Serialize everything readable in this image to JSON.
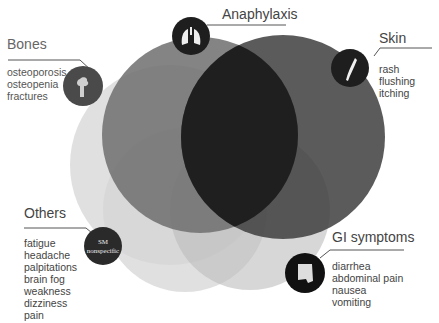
{
  "diagram": {
    "type": "venn",
    "colors": {
      "anaphylaxis_circle": "#777777",
      "skin_circle": "#555555",
      "bones_circle": "#d8d8d8",
      "others_circle": "#dcdcdc",
      "gi_circle": "#c8c8c8",
      "icon_badge": "#1e1e1e",
      "text": "#444444",
      "leader_line": "#555555"
    },
    "groups": [
      {
        "id": "anaphylaxis",
        "title": "Anaphylaxis",
        "icon": "lungs-icon",
        "items": []
      },
      {
        "id": "bones",
        "title": "Bones",
        "icon": "bone-icon",
        "items": [
          "osteoporosis",
          "osteopenia",
          "fractures"
        ]
      },
      {
        "id": "skin",
        "title": "Skin",
        "icon": "skin-icon",
        "items": [
          "rash",
          "flushing",
          "itching"
        ]
      },
      {
        "id": "others",
        "title": "Others",
        "icon": "sm-nonspecific-badge",
        "badge_lines": [
          "SM",
          "nonspecific"
        ],
        "items": [
          "fatigue",
          "headache",
          "palpitations",
          "brain fog",
          "weakness",
          "dizziness",
          "pain"
        ]
      },
      {
        "id": "gi",
        "title": "GI symptoms",
        "icon": "intestine-icon",
        "items": [
          "diarrhea",
          "abdominal pain",
          "nausea",
          "vomiting"
        ]
      }
    ]
  }
}
